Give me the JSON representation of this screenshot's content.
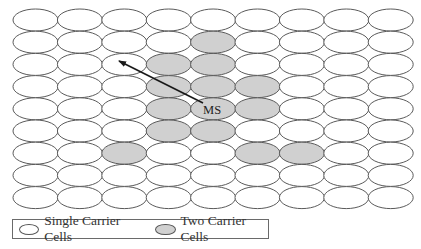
{
  "grid": {
    "rows": 9,
    "cols": 9,
    "origin_x": 35.5,
    "origin_y": 20,
    "col_spacing": 44.4,
    "row_spacing": 22.2,
    "rx": 22.5,
    "ry": 11,
    "shaded_cells": [
      [
        1,
        4
      ],
      [
        2,
        3
      ],
      [
        2,
        4
      ],
      [
        3,
        3
      ],
      [
        3,
        4
      ],
      [
        3,
        5
      ],
      [
        4,
        3
      ],
      [
        4,
        4
      ],
      [
        4,
        5
      ],
      [
        5,
        3
      ],
      [
        5,
        4
      ],
      [
        6,
        2
      ],
      [
        6,
        5
      ],
      [
        6,
        6
      ]
    ]
  },
  "colors": {
    "single_fill": "#ffffff",
    "two_fill": "#d0d0d0",
    "stroke": "#5a5a5a",
    "arrow": "#1a1a1a"
  },
  "mobile_station": {
    "label": "MS",
    "row": 4,
    "col": 4,
    "arrow_from": [
      203,
      103
    ],
    "arrow_to": [
      119,
      61
    ]
  },
  "legend": {
    "single_label": "Single Carrier Cells",
    "two_label": "Two Carrier Cells"
  }
}
